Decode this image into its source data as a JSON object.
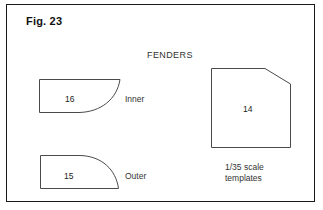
{
  "figure": {
    "title": "Fig. 23",
    "heading": "FENDERS",
    "border_color": "#1a1a1a",
    "stroke_color": "#4a4a4a",
    "background_color": "#ffffff"
  },
  "shapes": [
    {
      "id": "inner-fender",
      "number": "16",
      "label": "Inner",
      "outline": "rectangle with concave curve cut from bottom-right"
    },
    {
      "id": "outer-fender",
      "number": "15",
      "label": "Outer",
      "outline": "rectangle with convex quarter-round right side"
    },
    {
      "id": "template-panel",
      "number": "14",
      "label": "",
      "outline": "rectangle with chamfered top-right corner"
    }
  ],
  "caption": {
    "line1": "1/35 scale",
    "line2": "templates"
  }
}
